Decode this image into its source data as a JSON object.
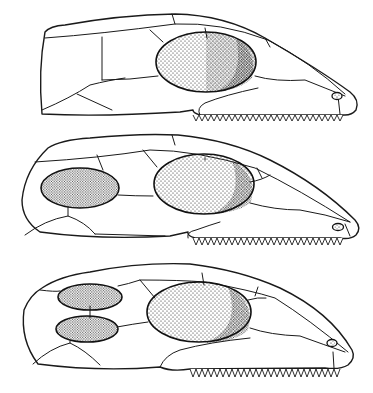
{
  "figure": {
    "panels": [
      {
        "id": "top",
        "name": "anapsid-style skull",
        "temporal_openings": 0,
        "orbit": true
      },
      {
        "id": "middle",
        "name": "synapsid-style skull",
        "temporal_openings": 1,
        "orbit": true
      },
      {
        "id": "bottom",
        "name": "diapsid-style skull",
        "temporal_openings": 2,
        "orbit": true
      }
    ],
    "colors": {
      "line": "#1a1a1a",
      "background": "#ffffff",
      "stipple": "#111111"
    }
  }
}
